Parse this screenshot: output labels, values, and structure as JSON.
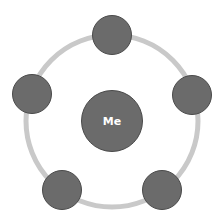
{
  "diagram": {
    "type": "hub-and-ring",
    "center": {
      "label": "Me"
    },
    "ring_nodes": [
      {
        "position": "top",
        "label": ""
      },
      {
        "position": "right",
        "label": ""
      },
      {
        "position": "bottom-right",
        "label": ""
      },
      {
        "position": "bottom-left",
        "label": ""
      },
      {
        "position": "left",
        "label": ""
      }
    ],
    "colors": {
      "node_fill": "#6b6b6b",
      "node_stroke": "#4a4a4a",
      "ring": "#c9c9c9",
      "label": "#ffffff"
    }
  }
}
